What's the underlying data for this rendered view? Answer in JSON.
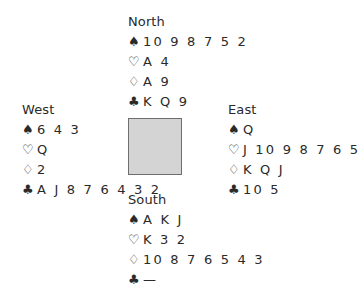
{
  "suit_symbols": {
    "spades": "♠",
    "hearts": "♡",
    "diamonds": "♢",
    "clubs": "♣"
  },
  "colors": {
    "text": "#2a2a2a",
    "table_fill": "#d4d4d4",
    "table_border": "#6e6e6e"
  },
  "hands": {
    "north": {
      "label": "North",
      "spades": "10 9 8 7 5 2",
      "hearts": "A 4",
      "diamonds": "A 9",
      "clubs": "K Q 9"
    },
    "west": {
      "label": "West",
      "spades": "6 4 3",
      "hearts": "Q",
      "diamonds": "2",
      "clubs": "A J 8 7 6 4 3 2"
    },
    "east": {
      "label": "East",
      "spades": "Q",
      "hearts": "J 10 9 8 7 6 5",
      "diamonds": "K Q J",
      "clubs": "10 5"
    },
    "south": {
      "label": "South",
      "spades": "A K J",
      "hearts": "K 3 2",
      "diamonds": "10 8 7 6 5 4 3",
      "clubs": "—"
    }
  }
}
